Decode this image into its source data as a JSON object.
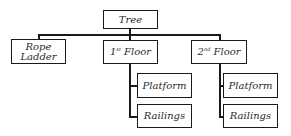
{
  "diagram": {
    "type": "tree",
    "root": {
      "label": "Tree",
      "children": [
        {
          "label_line1": "Rope",
          "label_line2": "Ladder"
        },
        {
          "num": "1",
          "sup": "st",
          "rest": " Floor",
          "children": [
            {
              "label": "Platform"
            },
            {
              "label": "Railings"
            }
          ]
        },
        {
          "num": "2",
          "sup": "nd",
          "rest": " Floor",
          "children": [
            {
              "label": "Platform"
            },
            {
              "label": "Railings"
            }
          ]
        }
      ]
    }
  },
  "colors": {
    "line": "#1a1a1a",
    "text": "#2a2a2a",
    "background": "#ffffff"
  }
}
